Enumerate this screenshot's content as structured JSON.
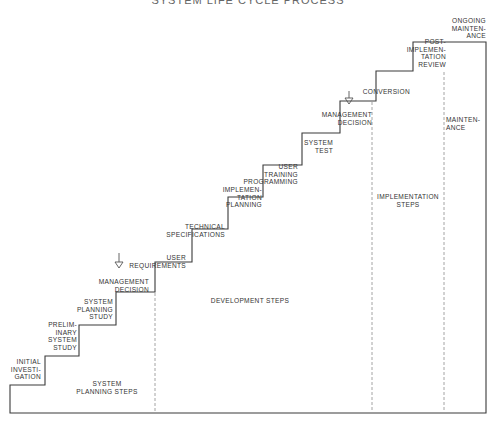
{
  "diagram": {
    "title": "SYSTEM LIFE CYCLE PROCESS",
    "steps": [
      {
        "id": "initial-investigation",
        "label": "INITIAL\nINVESTI-\nGATION"
      },
      {
        "id": "preliminary-system-study",
        "label": "PRELIM-\nINARY\nSYSTEM\nSTUDY"
      },
      {
        "id": "system-planning-study",
        "label": "SYSTEM\nPLANNING\nSTUDY"
      },
      {
        "id": "management-decision-1",
        "label": "MANAGEMENT\nDECISION"
      },
      {
        "id": "user-requirements",
        "label": "USER\nREQUIREMENTS"
      },
      {
        "id": "technical-specifications",
        "label": "TECHNICAL\nSPECIFICATIONS"
      },
      {
        "id": "implementation-planning",
        "label": "IMPLEMEN-\nTATION\nPLANNING"
      },
      {
        "id": "user-training-programming",
        "label": "USER\nTRAINING\nPROGRAMMING"
      },
      {
        "id": "system-test",
        "label": "SYSTEM\nTEST"
      },
      {
        "id": "management-decision-2",
        "label": "MANAGEMENT\nDECISION"
      },
      {
        "id": "conversion",
        "label": "CONVERSION"
      },
      {
        "id": "post-implementation-review",
        "label": "POST-\nIMPLEMEN-\nTATION\nREVIEW"
      },
      {
        "id": "ongoing-maintenance",
        "label": "ONGOING\nMAINTEN-\nANCE"
      }
    ],
    "phases": [
      {
        "id": "system-planning-steps",
        "label": "SYSTEM\nPLANNING STEPS"
      },
      {
        "id": "development-steps",
        "label": "DEVELOPMENT STEPS"
      },
      {
        "id": "implementation-steps",
        "label": "IMPLEMENTATION\nSTEPS"
      },
      {
        "id": "maintenance",
        "label": "MAINTEN-\nANCE"
      }
    ],
    "decision_markers": [
      {
        "id": "decision-arrow-1",
        "symbol": "down-arrow-triangle"
      },
      {
        "id": "decision-arrow-2",
        "symbol": "down-arrow-triangle"
      }
    ],
    "colors": {
      "line": "#3a3a3a",
      "dashed": "#9a9a9a",
      "text": "#333333"
    }
  }
}
